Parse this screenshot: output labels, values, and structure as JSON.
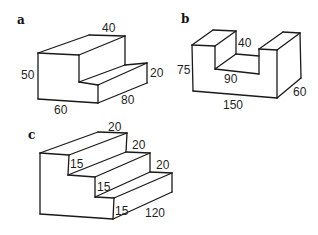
{
  "figure": {
    "stroke_color": "#1a1a1a",
    "panels": [
      {
        "id": "a",
        "label": "a",
        "label_pos": [
          17,
          24
        ],
        "shape": "single-step block",
        "edges": [
          [
            [
              38,
              53
            ],
            [
              89,
              35
            ]
          ],
          [
            [
              89,
              35
            ],
            [
              125,
              36
            ]
          ],
          [
            [
              125,
              36
            ],
            [
              79,
              55
            ]
          ],
          [
            [
              38,
              53
            ],
            [
              79,
              55
            ]
          ],
          [
            [
              38,
              53
            ],
            [
              38,
              99
            ]
          ],
          [
            [
              38,
              99
            ],
            [
              98,
              103
            ]
          ],
          [
            [
              79,
              55
            ],
            [
              79,
              82
            ]
          ],
          [
            [
              125,
              36
            ],
            [
              125,
              65
            ]
          ],
          [
            [
              79,
              82
            ],
            [
              125,
              65
            ]
          ],
          [
            [
              79,
              82
            ],
            [
              98,
              85
            ]
          ],
          [
            [
              98,
              85
            ],
            [
              147,
              63
            ]
          ],
          [
            [
              125,
              65
            ],
            [
              147,
              63
            ]
          ],
          [
            [
              147,
              63
            ],
            [
              147,
              83
            ]
          ],
          [
            [
              98,
              85
            ],
            [
              98,
              103
            ]
          ],
          [
            [
              98,
              103
            ],
            [
              147,
              83
            ]
          ]
        ],
        "dimensions": [
          {
            "text": "40",
            "pos": [
              102,
              32
            ]
          },
          {
            "text": "50",
            "pos": [
              21,
              79
            ]
          },
          {
            "text": "20",
            "pos": [
              150,
              77
            ]
          },
          {
            "text": "60",
            "pos": [
              54,
              114
            ]
          },
          {
            "text": "80",
            "pos": [
              121,
              104
            ]
          }
        ]
      },
      {
        "id": "b",
        "label": "b",
        "label_pos": [
          181,
          23
        ],
        "shape": "U-channel block",
        "edges": [
          [
            [
              192,
              45
            ],
            [
              213,
              30
            ]
          ],
          [
            [
              213,
              30
            ],
            [
              236,
              31
            ]
          ],
          [
            [
              236,
              31
            ],
            [
              215,
              46
            ]
          ],
          [
            [
              192,
              45
            ],
            [
              215,
              46
            ]
          ],
          [
            [
              192,
              45
            ],
            [
              193,
              91
            ]
          ],
          [
            [
              215,
              46
            ],
            [
              215,
              69
            ]
          ],
          [
            [
              236,
              31
            ],
            [
              236,
              54
            ]
          ],
          [
            [
              236,
              54
            ],
            [
              259,
              56
            ]
          ],
          [
            [
              215,
              69
            ],
            [
              259,
              74
            ]
          ],
          [
            [
              215,
              69
            ],
            [
              236,
              54
            ]
          ],
          [
            [
              259,
              49
            ],
            [
              283,
              32
            ]
          ],
          [
            [
              283,
              32
            ],
            [
              300,
              33
            ]
          ],
          [
            [
              300,
              33
            ],
            [
              277,
              50
            ]
          ],
          [
            [
              259,
              49
            ],
            [
              277,
              50
            ]
          ],
          [
            [
              259,
              49
            ],
            [
              259,
              74
            ]
          ],
          [
            [
              277,
              50
            ],
            [
              277,
              98
            ]
          ],
          [
            [
              300,
              33
            ],
            [
              301,
              78
            ]
          ],
          [
            [
              193,
              91
            ],
            [
              277,
              98
            ]
          ],
          [
            [
              277,
              98
            ],
            [
              301,
              78
            ]
          ]
        ],
        "dimensions": [
          {
            "text": "40",
            "pos": [
              238,
              47
            ]
          },
          {
            "text": "75",
            "pos": [
              177,
              74
            ]
          },
          {
            "text": "90",
            "pos": [
              224,
              83
            ]
          },
          {
            "text": "150",
            "pos": [
              223,
              109
            ]
          },
          {
            "text": "60",
            "pos": [
              293,
              96
            ]
          }
        ]
      },
      {
        "id": "c",
        "label": "c",
        "label_pos": [
          28,
          139
        ],
        "shape": "three-step staircase",
        "edges": [
          [
            [
              40,
              153
            ],
            [
              98,
              132
            ]
          ],
          [
            [
              98,
              132
            ],
            [
              127,
              133
            ]
          ],
          [
            [
              127,
              133
            ],
            [
              69,
              155
            ]
          ],
          [
            [
              40,
              153
            ],
            [
              69,
              155
            ]
          ],
          [
            [
              40,
              153
            ],
            [
              40,
              214
            ]
          ],
          [
            [
              40,
              214
            ],
            [
              113,
              219
            ]
          ],
          [
            [
              69,
              155
            ],
            [
              68,
              175
            ]
          ],
          [
            [
              127,
              133
            ],
            [
              126,
              152
            ]
          ],
          [
            [
              68,
              175
            ],
            [
              95,
              177
            ]
          ],
          [
            [
              68,
              175
            ],
            [
              126,
              152
            ]
          ],
          [
            [
              126,
              152
            ],
            [
              150,
              153
            ]
          ],
          [
            [
              95,
              177
            ],
            [
              150,
              153
            ]
          ],
          [
            [
              95,
              177
            ],
            [
              95,
              197
            ]
          ],
          [
            [
              150,
              153
            ],
            [
              150,
              172
            ]
          ],
          [
            [
              95,
              197
            ],
            [
              114,
              198
            ]
          ],
          [
            [
              95,
              197
            ],
            [
              150,
              172
            ]
          ],
          [
            [
              150,
              172
            ],
            [
              172,
              173
            ]
          ],
          [
            [
              114,
              198
            ],
            [
              172,
              173
            ]
          ],
          [
            [
              114,
              198
            ],
            [
              113,
              219
            ]
          ],
          [
            [
              172,
              173
            ],
            [
              172,
              192
            ]
          ],
          [
            [
              113,
              219
            ],
            [
              172,
              192
            ]
          ]
        ],
        "dimensions": [
          {
            "text": "20",
            "pos": [
              108,
              131
            ]
          },
          {
            "text": "20",
            "pos": [
              132,
              149
            ]
          },
          {
            "text": "20",
            "pos": [
              156,
              169
            ]
          },
          {
            "text": "15",
            "pos": [
              70,
              168
            ]
          },
          {
            "text": "15",
            "pos": [
              97,
              191
            ]
          },
          {
            "text": "15",
            "pos": [
              115,
              215
            ]
          },
          {
            "text": "120",
            "pos": [
              145,
              217
            ]
          }
        ]
      }
    ]
  }
}
